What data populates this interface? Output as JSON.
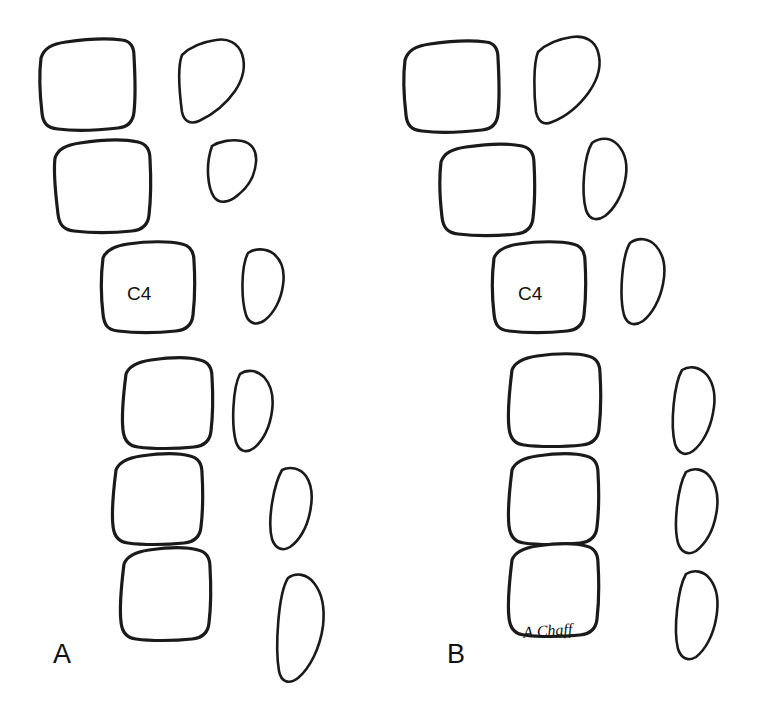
{
  "figure": {
    "type": "line-drawing",
    "background_color": "#ffffff",
    "ink_color": "#1a1a1a",
    "panels": [
      {
        "id": "panel-a",
        "label": "A",
        "vertebra_label": "C4",
        "body_count": 6,
        "spinous_count": 6
      },
      {
        "id": "panel-b",
        "label": "B",
        "vertebra_label": "C4",
        "body_count": 6,
        "spinous_count": 6,
        "signature": "A.Chaff"
      }
    ]
  },
  "labels": {
    "panel_a": "A",
    "panel_b": "B",
    "c4_left": "C4",
    "c4_right": "C4",
    "artist_signature": "A.Chaff"
  }
}
